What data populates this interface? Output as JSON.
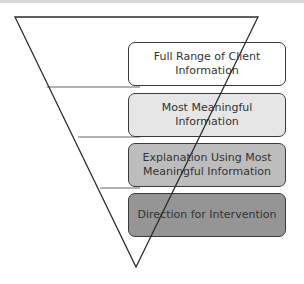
{
  "diagram": {
    "type": "inverted-funnel",
    "levels": [
      {
        "label": "Full Range of Client Information",
        "fill": "#ffffff"
      },
      {
        "label": "Most Meaningful Information",
        "fill": "#e6e6e6"
      },
      {
        "label": "Explanation Using Most Meaningful Information",
        "fill": "#bdbdbd"
      },
      {
        "label": "Direction for Intervention",
        "fill": "#959595"
      }
    ],
    "colors": {
      "outline": "#2b2b2b",
      "text": "#333333",
      "divider": "#666666"
    }
  }
}
